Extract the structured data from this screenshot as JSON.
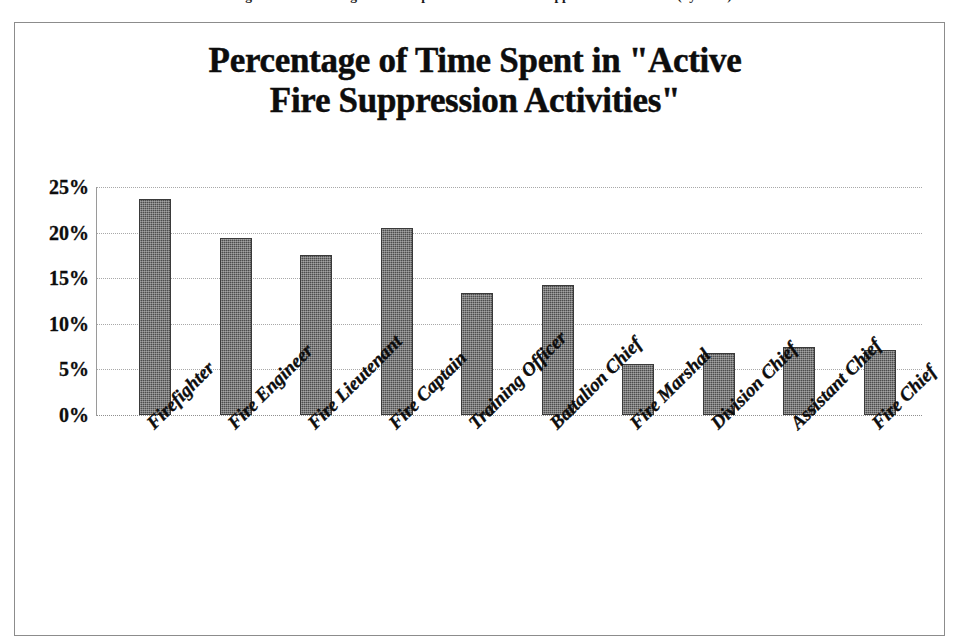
{
  "caption": {
    "text": "Figure 3.3: Percentage of Time Spent in \"Active Fire Suppression Activities\" (by rank)"
  },
  "chart": {
    "title_line_1": "Percentage of Time Spent in \"Active",
    "title_line_2": "Fire Suppression Activities\""
  },
  "colors": {
    "bar_fill": "#4d4d4d",
    "bar_edge": "#3a3a3a",
    "gridline": "#a8a8a8",
    "frame_border": "#8c8c8c",
    "text": "#0d0d0d",
    "background": "#ffffff"
  },
  "chart_data": {
    "type": "bar",
    "title": "Percentage of Time Spent in \"Active Fire Suppression Activities\"",
    "xlabel": "",
    "ylabel": "",
    "ylim": [
      0,
      25
    ],
    "ytick_labels": [
      "25%",
      "20%",
      "15%",
      "10%",
      "5%",
      "0%"
    ],
    "ytick_values": [
      25,
      20,
      15,
      10,
      5,
      0
    ],
    "grid": true,
    "legend": false,
    "categories": [
      "Firefighter",
      "Fire Engineer",
      "Fire Lieutenant",
      "Fire Captain",
      "Training Officer",
      "Battalion Chief",
      "Fire Marshal",
      "Division Chief",
      "Assistant Chief",
      "Fire Chief"
    ],
    "values": [
      23.7,
      19.4,
      17.5,
      20.5,
      13.4,
      14.3,
      5.6,
      6.8,
      7.5,
      7.1
    ],
    "value_unit": "%"
  }
}
